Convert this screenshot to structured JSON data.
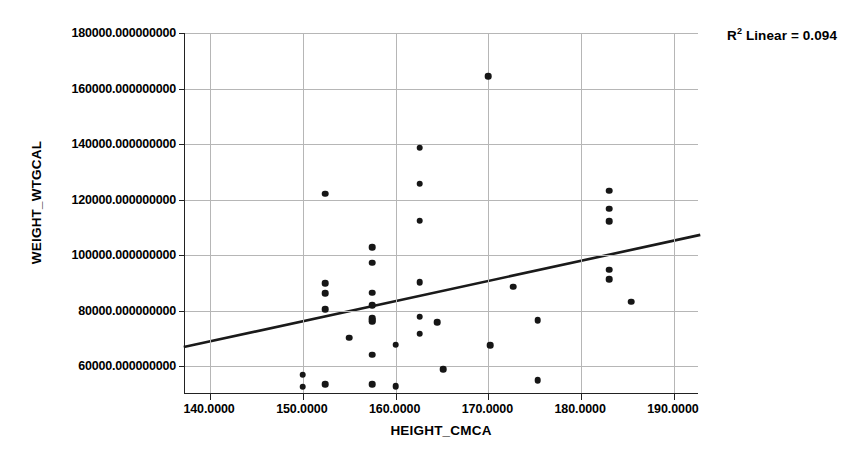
{
  "chart_data": {
    "type": "scatter",
    "title": "",
    "xlabel": "HEIGHT_CMCA",
    "ylabel": "WEIGHT_WTGCAL",
    "xlim": [
      137.3,
      192.7
    ],
    "ylim": [
      50000,
      180000
    ],
    "grid": true,
    "x_ticks": [
      140,
      150,
      160,
      170,
      180,
      190
    ],
    "x_tick_labels": [
      "140.0000",
      "150.0000",
      "160.0000",
      "170.0000",
      "180.0000",
      "190.0000"
    ],
    "y_ticks": [
      60000,
      80000,
      100000,
      120000,
      140000,
      160000,
      180000
    ],
    "y_tick_labels": [
      "60000.000000000",
      "80000.000000000",
      "100000.000000000",
      "120000.000000000",
      "140000.000000000",
      "160000.000000000",
      "180000.000000000"
    ],
    "annotation": "R² Linear = 0.094",
    "annotation_prefix": "R",
    "annotation_superscript": "2",
    "annotation_suffix": " Linear = 0.094",
    "r_squared": 0.094,
    "point_color": "#161616",
    "line_color": "#1a1a1a",
    "grid_color": "#b6b6b6",
    "axis_color": "#222222",
    "fit_line": {
      "x_start": 137.3,
      "y_start": 67000,
      "x_end": 192.7,
      "y_end": 107200
    },
    "points": [
      {
        "x": 150.0,
        "y": 57000
      },
      {
        "x": 150.0,
        "y": 52700
      },
      {
        "x": 152.4,
        "y": 122200
      },
      {
        "x": 152.4,
        "y": 89800
      },
      {
        "x": 152.4,
        "y": 86200
      },
      {
        "x": 152.4,
        "y": 80600
      },
      {
        "x": 152.4,
        "y": 53600
      },
      {
        "x": 155.0,
        "y": 70300
      },
      {
        "x": 157.5,
        "y": 102900
      },
      {
        "x": 157.5,
        "y": 97300
      },
      {
        "x": 157.5,
        "y": 86500
      },
      {
        "x": 157.5,
        "y": 82000
      },
      {
        "x": 157.5,
        "y": 77200
      },
      {
        "x": 157.5,
        "y": 76600
      },
      {
        "x": 157.5,
        "y": 76000
      },
      {
        "x": 157.5,
        "y": 64200
      },
      {
        "x": 157.5,
        "y": 53500
      },
      {
        "x": 160.0,
        "y": 67800
      },
      {
        "x": 160.0,
        "y": 52800
      },
      {
        "x": 162.6,
        "y": 138700
      },
      {
        "x": 162.6,
        "y": 125700
      },
      {
        "x": 162.6,
        "y": 112400
      },
      {
        "x": 162.6,
        "y": 90200
      },
      {
        "x": 162.6,
        "y": 77800
      },
      {
        "x": 162.6,
        "y": 71700
      },
      {
        "x": 164.5,
        "y": 75900
      },
      {
        "x": 165.1,
        "y": 58900
      },
      {
        "x": 170.0,
        "y": 164500
      },
      {
        "x": 170.2,
        "y": 67500
      },
      {
        "x": 172.7,
        "y": 88600
      },
      {
        "x": 175.3,
        "y": 76600
      },
      {
        "x": 175.3,
        "y": 54900
      },
      {
        "x": 183.0,
        "y": 123200
      },
      {
        "x": 183.0,
        "y": 116800
      },
      {
        "x": 183.0,
        "y": 112200
      },
      {
        "x": 183.0,
        "y": 94800
      },
      {
        "x": 183.0,
        "y": 91400
      },
      {
        "x": 185.4,
        "y": 83200
      }
    ]
  },
  "caption": {
    "remnant": ""
  }
}
